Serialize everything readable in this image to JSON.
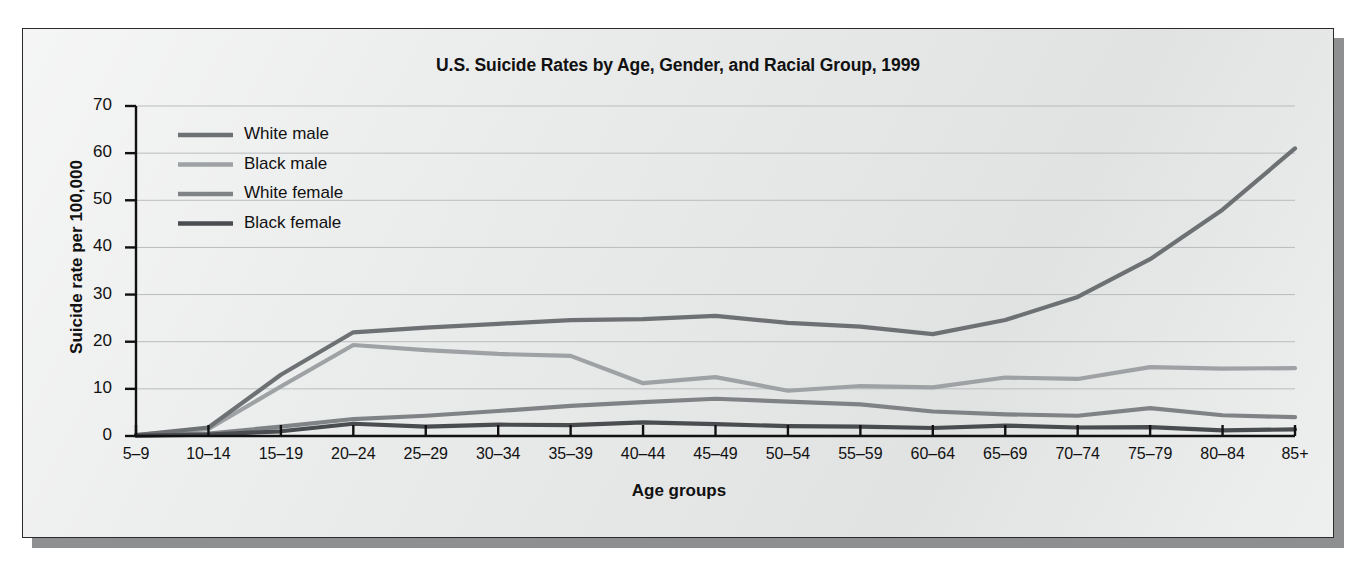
{
  "chart_data": {
    "type": "line",
    "title": "U.S. Suicide Rates by Age, Gender, and Racial Group, 1999",
    "xlabel": "Age groups",
    "ylabel": "Suicide rate per 100,000",
    "grid": true,
    "legend_position": "upper-left inside",
    "ylim": [
      0,
      70
    ],
    "yticks": [
      0,
      10,
      20,
      30,
      40,
      50,
      60,
      70
    ],
    "categories": [
      "5–9",
      "10–14",
      "15–19",
      "20–24",
      "25–29",
      "30–34",
      "35–39",
      "40–44",
      "45–49",
      "50–54",
      "55–59",
      "60–64",
      "65–69",
      "70–74",
      "75–79",
      "80–84",
      "85+"
    ],
    "series": [
      {
        "name": "White male",
        "color": "#6e7173",
        "values": [
          0.2,
          1.8,
          13.0,
          22.0,
          23.0,
          23.8,
          24.6,
          24.8,
          25.5,
          24.0,
          23.2,
          21.6,
          24.6,
          29.5,
          37.5,
          48.0,
          61.0
        ]
      },
      {
        "name": "Black male",
        "color": "#9fa2a4",
        "values": [
          0.2,
          1.5,
          10.5,
          19.3,
          18.2,
          17.4,
          17.0,
          11.2,
          12.5,
          9.6,
          10.6,
          10.3,
          12.4,
          12.1,
          14.6,
          14.3,
          14.4
        ]
      },
      {
        "name": "White female",
        "color": "#808385",
        "values": [
          0.1,
          0.5,
          2.0,
          3.6,
          4.3,
          5.3,
          6.4,
          7.2,
          7.9,
          7.3,
          6.7,
          5.2,
          4.6,
          4.3,
          5.9,
          4.4,
          4.0
        ]
      },
      {
        "name": "Black female",
        "color": "#4a4d4f",
        "values": [
          0.1,
          0.3,
          1.0,
          2.6,
          2.0,
          2.4,
          2.3,
          2.9,
          2.5,
          2.1,
          2.0,
          1.7,
          2.2,
          1.8,
          1.9,
          1.2,
          1.4
        ]
      }
    ]
  },
  "legend": {
    "items": [
      {
        "label": "White male"
      },
      {
        "label": "Black male"
      },
      {
        "label": "White female"
      },
      {
        "label": "Black female"
      }
    ]
  },
  "colors": {
    "panel_background": "#e9eaea",
    "frame": "#2b2b2b",
    "gridline": "#b9bcbe",
    "axis": "#111111",
    "shadow": "#8d8f91"
  }
}
